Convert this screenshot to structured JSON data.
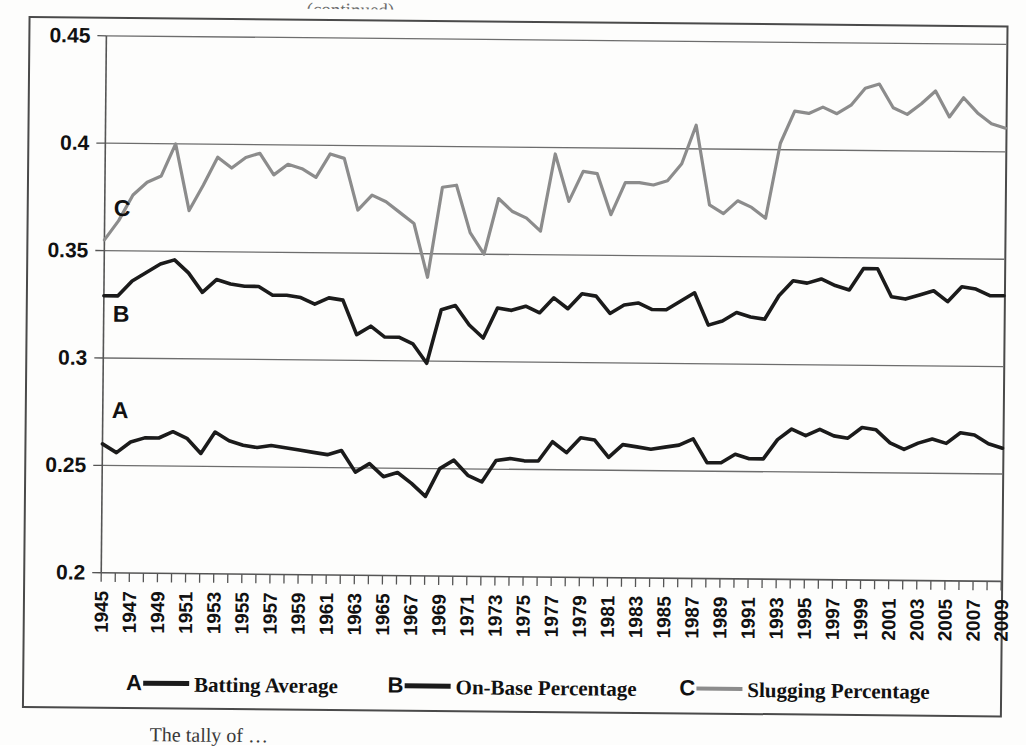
{
  "figure": {
    "caption": "The tally of …",
    "top_fragment": "(continued)"
  },
  "chart_data": {
    "type": "line",
    "title": "",
    "xlabel": "",
    "ylabel": "",
    "ylim": [
      0.2,
      0.45
    ],
    "ytick_labels": [
      "0.2",
      "0.25",
      "0.3",
      "0.35",
      "0.4",
      "0.45"
    ],
    "ytick_values": [
      0.2,
      0.25,
      0.3,
      0.35,
      0.4,
      0.45
    ],
    "grid": true,
    "grid_axis": "y",
    "legend_position": "bottom",
    "x_start": 1945,
    "x_end": 2009,
    "xtick_labels": [
      "1945",
      "1947",
      "1949",
      "1951",
      "1953",
      "1955",
      "1957",
      "1959",
      "1961",
      "1963",
      "1965",
      "1967",
      "1969",
      "1971",
      "1973",
      "1975",
      "1977",
      "1979",
      "1981",
      "1983",
      "1985",
      "1987",
      "1989",
      "1991",
      "1993",
      "1995",
      "1997",
      "1999",
      "2001",
      "2003",
      "2005",
      "2007",
      "2009"
    ],
    "x": [
      1945,
      1946,
      1947,
      1948,
      1949,
      1950,
      1951,
      1952,
      1953,
      1954,
      1955,
      1956,
      1957,
      1958,
      1959,
      1960,
      1961,
      1962,
      1963,
      1964,
      1965,
      1966,
      1967,
      1968,
      1969,
      1970,
      1971,
      1972,
      1973,
      1974,
      1975,
      1976,
      1977,
      1978,
      1979,
      1980,
      1981,
      1982,
      1983,
      1984,
      1985,
      1986,
      1987,
      1988,
      1989,
      1990,
      1991,
      1992,
      1993,
      1994,
      1995,
      1996,
      1997,
      1998,
      1999,
      2000,
      2001,
      2002,
      2003,
      2004,
      2005,
      2006,
      2007,
      2008,
      2009
    ],
    "series": [
      {
        "name": "Batting Average",
        "tag": "A",
        "color": "#1b1b1b",
        "values": [
          0.26,
          0.256,
          0.261,
          0.263,
          0.263,
          0.266,
          0.263,
          0.256,
          0.266,
          0.262,
          0.26,
          0.259,
          0.26,
          0.259,
          0.258,
          0.257,
          0.256,
          0.258,
          0.248,
          0.252,
          0.246,
          0.248,
          0.243,
          0.237,
          0.25,
          0.254,
          0.247,
          0.244,
          0.254,
          0.255,
          0.254,
          0.254,
          0.263,
          0.258,
          0.265,
          0.264,
          0.256,
          0.262,
          0.261,
          0.26,
          0.261,
          0.262,
          0.265,
          0.254,
          0.254,
          0.258,
          0.256,
          0.256,
          0.265,
          0.27,
          0.267,
          0.27,
          0.267,
          0.266,
          0.271,
          0.27,
          0.264,
          0.261,
          0.264,
          0.266,
          0.264,
          0.269,
          0.268,
          0.264,
          0.262
        ]
      },
      {
        "name": "On-Base Percentage",
        "tag": "B",
        "color": "#1b1b1b",
        "values": [
          0.329,
          0.329,
          0.336,
          0.34,
          0.344,
          0.346,
          0.34,
          0.331,
          0.337,
          0.335,
          0.334,
          0.334,
          0.33,
          0.33,
          0.329,
          0.326,
          0.329,
          0.328,
          0.312,
          0.316,
          0.311,
          0.311,
          0.308,
          0.299,
          0.324,
          0.326,
          0.317,
          0.311,
          0.325,
          0.324,
          0.326,
          0.323,
          0.33,
          0.325,
          0.332,
          0.331,
          0.323,
          0.327,
          0.328,
          0.325,
          0.325,
          0.329,
          0.333,
          0.318,
          0.32,
          0.324,
          0.322,
          0.321,
          0.332,
          0.339,
          0.338,
          0.34,
          0.337,
          0.335,
          0.345,
          0.345,
          0.332,
          0.331,
          0.333,
          0.335,
          0.33,
          0.337,
          0.336,
          0.333,
          0.333
        ]
      },
      {
        "name": "Slugging Percentage",
        "tag": "C",
        "color": "#8c8c8c",
        "values": [
          0.355,
          0.364,
          0.376,
          0.382,
          0.385,
          0.4,
          0.369,
          0.381,
          0.394,
          0.389,
          0.394,
          0.396,
          0.386,
          0.391,
          0.389,
          0.385,
          0.396,
          0.394,
          0.37,
          0.377,
          0.374,
          0.369,
          0.364,
          0.339,
          0.381,
          0.382,
          0.36,
          0.35,
          0.376,
          0.37,
          0.367,
          0.361,
          0.397,
          0.375,
          0.389,
          0.388,
          0.369,
          0.384,
          0.384,
          0.383,
          0.385,
          0.393,
          0.411,
          0.374,
          0.37,
          0.376,
          0.373,
          0.368,
          0.403,
          0.418,
          0.417,
          0.42,
          0.417,
          0.421,
          0.429,
          0.431,
          0.42,
          0.417,
          0.422,
          0.428,
          0.416,
          0.425,
          0.418,
          0.413,
          0.411
        ]
      }
    ]
  },
  "legend": {
    "items": [
      {
        "letter": "A",
        "label": "Batting Average"
      },
      {
        "letter": "B",
        "label": "On-Base Percentage"
      },
      {
        "letter": "C",
        "label": "Slugging Percentage"
      }
    ]
  },
  "series_tags": {
    "a": "A",
    "b": "B",
    "c": "C"
  },
  "colors": {
    "dark_line": "#1b1b1b",
    "gray_line": "#8c8c8c",
    "axis": "#555555",
    "page": "#fdfdfc"
  }
}
